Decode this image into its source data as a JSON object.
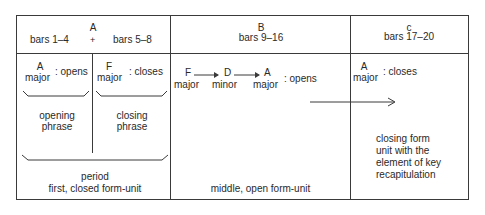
{
  "header": {
    "section_a": {
      "letter": "A",
      "left_bars": "bars 1–4",
      "plus": "+",
      "right_bars": "bars 5–8"
    },
    "section_b": {
      "letter": "B",
      "bars": "bars 9–16"
    },
    "section_c": {
      "letter": "c",
      "bars": "bars 17–20"
    }
  },
  "section_a": {
    "left": {
      "key": "A",
      "mode": "major",
      "function": ": opens",
      "phrase_line1": "opening",
      "phrase_line2": "phrase"
    },
    "right": {
      "key": "F",
      "mode": "major",
      "function": ": closes",
      "phrase_line1": "closing",
      "phrase_line2": "phrase"
    },
    "period": "period",
    "caption": "first, closed  form-unit"
  },
  "section_b": {
    "modulation": [
      {
        "key": "F",
        "mode": "major"
      },
      {
        "key": "D",
        "mode": "minor"
      },
      {
        "key": "A",
        "mode": "major"
      }
    ],
    "function": ": opens",
    "caption": "middle, open form-unit"
  },
  "section_c": {
    "key": "A",
    "mode": "major",
    "function": ": closes",
    "caption_lines": [
      "closing form",
      "unit with the",
      "element of key",
      "recapitulation"
    ]
  },
  "colors": {
    "line": "#3a3a3a",
    "text": "#2a2a2a",
    "background": "#ffffff"
  }
}
